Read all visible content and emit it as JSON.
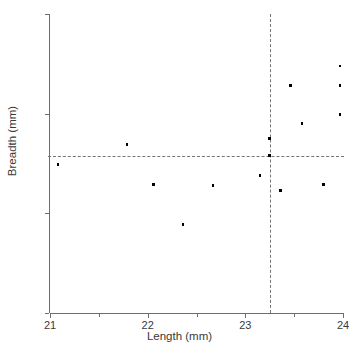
{
  "chart_data": {
    "type": "scatter",
    "title": "",
    "xlabel": "Length (mm)",
    "ylabel": "Breadth (mm)",
    "xlim": [
      21,
      24
    ],
    "ylim": [
      15,
      18
    ],
    "xticks": [
      21,
      22,
      23,
      24
    ],
    "yticks": [
      15,
      16,
      17,
      18
    ],
    "xtick_labels": [
      "21",
      "22",
      "23",
      "24"
    ],
    "ytick_labels": [
      "15",
      "16",
      "17",
      "18"
    ],
    "x_minor_ticks": [
      21.5,
      22.5,
      23.5
    ],
    "y_minor_ticks": [],
    "grid": false,
    "legend": null,
    "marker": "square",
    "marker_color": "#000000",
    "points": [
      {
        "x": 21.08,
        "y": 16.49
      },
      {
        "x": 21.79,
        "y": 16.69
      },
      {
        "x": 22.06,
        "y": 16.29
      },
      {
        "x": 22.36,
        "y": 15.89
      },
      {
        "x": 22.67,
        "y": 16.28
      },
      {
        "x": 23.15,
        "y": 16.38
      },
      {
        "x": 23.25,
        "y": 16.75
      },
      {
        "x": 23.25,
        "y": 16.58
      },
      {
        "x": 23.36,
        "y": 16.23
      },
      {
        "x": 23.46,
        "y": 17.28
      },
      {
        "x": 23.58,
        "y": 16.9
      },
      {
        "x": 23.8,
        "y": 16.29
      },
      {
        "x": 23.97,
        "y": 17.48
      },
      {
        "x": 23.97,
        "y": 17.28
      },
      {
        "x": 23.97,
        "y": 16.99
      }
    ],
    "reference_lines": {
      "horizontal": {
        "value": 16.58,
        "style": "dashed",
        "color": "#757575"
      },
      "vertical": {
        "value": 23.25,
        "style": "dashed",
        "color": "#757575"
      }
    }
  }
}
